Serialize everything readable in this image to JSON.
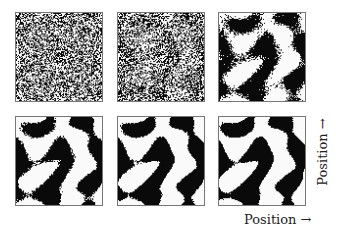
{
  "figure": {
    "panels": [
      {
        "id": 1,
        "stage": "random-noise",
        "order": 0.0
      },
      {
        "id": 2,
        "stage": "noise-with-faint-clusters",
        "order": 0.15
      },
      {
        "id": 3,
        "stage": "emerging-blobs",
        "order": 0.55
      },
      {
        "id": 4,
        "stage": "forming-stripes",
        "order": 0.75
      },
      {
        "id": 5,
        "stage": "labyrinth-stripes",
        "order": 0.9
      },
      {
        "id": 6,
        "stage": "labyrinth-stripes-final",
        "order": 1.0
      }
    ],
    "x_axis_label": "Position →",
    "y_axis_label": "Position →",
    "colors": {
      "ink": "#000000",
      "paper": "#ffffff",
      "border": "#777777"
    }
  }
}
